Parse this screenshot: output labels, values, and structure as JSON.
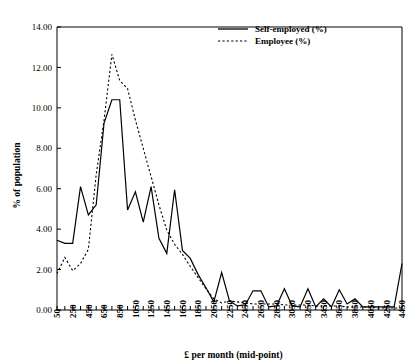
{
  "chart_data": {
    "type": "line",
    "title": "",
    "xlabel": "£ per month (mid-point)",
    "ylabel": "% of population",
    "ylim": [
      0,
      14
    ],
    "ytick_labels": [
      "0.00",
      "2.00",
      "4.00",
      "6.00",
      "8.00",
      "10.00",
      "12.00",
      "14.00"
    ],
    "ytick_values": [
      0,
      2,
      4,
      6,
      8,
      10,
      12,
      14
    ],
    "xlim": [
      50,
      4450
    ],
    "xtick_labels": [
      "50",
      "250",
      "450",
      "650",
      "850",
      "1050",
      "1250",
      "1450",
      "1650",
      "1850",
      "2050",
      "2250",
      "2450",
      "2650",
      "2850",
      "3050",
      "3250",
      "3450",
      "3650",
      "3850",
      "4050",
      "4250",
      "4450"
    ],
    "x": [
      50,
      150,
      250,
      350,
      450,
      550,
      650,
      750,
      850,
      950,
      1050,
      1150,
      1250,
      1350,
      1450,
      1550,
      1650,
      1750,
      1850,
      1950,
      2050,
      2150,
      2250,
      2350,
      2450,
      2550,
      2650,
      2750,
      2850,
      2950,
      3050,
      3150,
      3250,
      3350,
      3450,
      3550,
      3650,
      3750,
      3850,
      3950,
      4050,
      4150,
      4250,
      4350,
      4450
    ],
    "grid": false,
    "legend_position": "top-right",
    "series": [
      {
        "name": "Self-employed (%)",
        "style": "solid",
        "values": [
          3.45,
          3.3,
          3.3,
          6.1,
          4.7,
          5.2,
          9.25,
          10.4,
          10.4,
          4.95,
          5.85,
          4.35,
          6.1,
          3.55,
          2.8,
          5.95,
          2.95,
          2.55,
          1.75,
          1.1,
          0.4,
          1.85,
          0.45,
          0.2,
          0.25,
          0.95,
          0.95,
          0.15,
          0.2,
          1.05,
          0.2,
          0.15,
          1.05,
          0.15,
          0.55,
          0.15,
          1.0,
          0.3,
          0.55,
          0.15,
          0.15,
          0.15,
          0.15,
          0.15,
          2.3
        ]
      },
      {
        "name": "Employee (%)",
        "style": "dashed",
        "values": [
          1.8,
          2.6,
          1.95,
          2.3,
          3.0,
          6.7,
          9.4,
          12.65,
          11.35,
          10.95,
          9.4,
          8.0,
          6.6,
          5.2,
          3.95,
          3.25,
          2.75,
          2.15,
          1.6,
          1.05,
          0.55,
          0.35,
          0.45,
          0.4,
          0.35,
          0.3,
          0.3,
          0.3,
          0.3,
          0.25,
          0.25,
          0.25,
          0.25,
          0.2,
          0.2,
          0.2,
          0.2,
          0.15,
          0.15,
          0.15,
          0.15,
          0.1,
          0.1,
          0.1,
          0.1
        ]
      }
    ]
  },
  "legend": {
    "items": [
      {
        "label": "Self-employed (%)",
        "style": "solid"
      },
      {
        "label": "Employee (%)",
        "style": "dashed"
      }
    ]
  }
}
